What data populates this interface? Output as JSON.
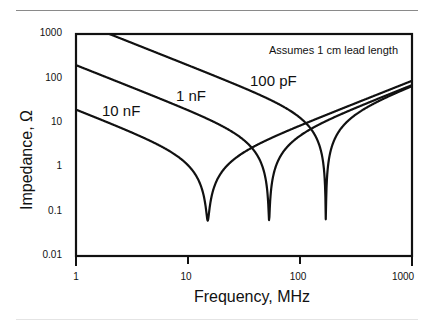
{
  "chart_data": {
    "type": "line",
    "title": "",
    "xlabel": "Frequency, MHz",
    "ylabel": "Impedance, Ω",
    "xscale": "log",
    "yscale": "log",
    "xlim": [
      1,
      1000
    ],
    "ylim": [
      0.01,
      1000
    ],
    "x_ticks": [
      "1",
      "10",
      "100",
      "1000"
    ],
    "y_ticks": [
      "1000",
      "100",
      "10",
      "1",
      "0.1",
      "0.01"
    ],
    "grid": false,
    "annotation": "Assumes 1 cm lead length",
    "series": [
      {
        "name": "10 nF",
        "capacitance_F": 1e-08,
        "resonance_MHz": 15,
        "min_impedance_ohm": 0.05,
        "points": [
          [
            1,
            20
          ],
          [
            3,
            7
          ],
          [
            8,
            2
          ],
          [
            12,
            0.8
          ],
          [
            15,
            0.05
          ],
          [
            20,
            1
          ],
          [
            50,
            5
          ],
          [
            100,
            10
          ],
          [
            1000,
            90
          ]
        ]
      },
      {
        "name": "1 nF",
        "capacitance_F": 1e-09,
        "resonance_MHz": 53,
        "min_impedance_ohm": 0.05,
        "points": [
          [
            1,
            190
          ],
          [
            5,
            38
          ],
          [
            10,
            18
          ],
          [
            25,
            6
          ],
          [
            40,
            2
          ],
          [
            53,
            0.05
          ],
          [
            70,
            3
          ],
          [
            100,
            8
          ],
          [
            1000,
            90
          ]
        ]
      },
      {
        "name": "100 pF",
        "capacitance_F": 1e-10,
        "resonance_MHz": 170,
        "min_impedance_ohm": 0.05,
        "points": [
          [
            2.4,
            1000
          ],
          [
            10,
            220
          ],
          [
            40,
            50
          ],
          [
            80,
            20
          ],
          [
            130,
            6
          ],
          [
            170,
            0.05
          ],
          [
            220,
            5
          ],
          [
            400,
            30
          ],
          [
            1000,
            90
          ]
        ]
      }
    ],
    "series_params": {
      "inductance_H": 1.05e-08,
      "esr_ohm": 0.05
    }
  },
  "labels": {
    "annotation": "Assumes 1 cm lead length",
    "xlabel": "Frequency, MHz",
    "ylabel": "Impedance, Ω",
    "curve_10nF": "10 nF",
    "curve_1nF": "1 nF",
    "curve_100pF": "100 pF",
    "x_ticks": [
      "1",
      "10",
      "100",
      "1000"
    ],
    "y_ticks": [
      "1000",
      "100",
      "10",
      "1",
      "0.1",
      "0.01"
    ]
  }
}
